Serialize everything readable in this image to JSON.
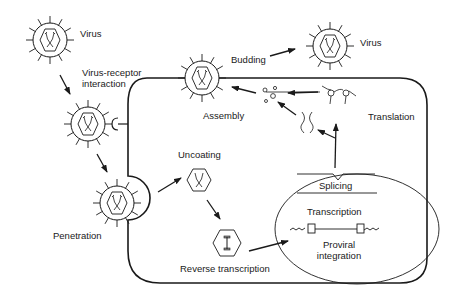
{
  "labels": {
    "virus_top_left": "Virus",
    "virus_receptor_line1": "Virus-receptor",
    "virus_receptor_line2": "interaction",
    "penetration": "Penetration",
    "uncoating": "Uncoating",
    "reverse_transcription": "Reverse transcription",
    "proviral_line1": "Proviral",
    "proviral_line2": "integration",
    "transcription": "Transcription",
    "splicing": "Splicing",
    "translation": "Translation",
    "assembly": "Assembly",
    "budding": "Budding",
    "virus_top_right": "Virus"
  },
  "colors": {
    "stroke": "#1a1a1a",
    "background": "#ffffff"
  }
}
